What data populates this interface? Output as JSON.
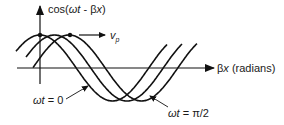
{
  "diagram": {
    "y_axis_label": {
      "prefix": "cos(",
      "omega_t": "ωt",
      "minus": " - β",
      "x": "x",
      "suffix": ")"
    },
    "x_axis_label": {
      "beta": "β",
      "x": "x",
      "units": " (radians)"
    },
    "velocity_label": {
      "v": "v",
      "sub": "p"
    },
    "annotations": [
      {
        "id": "wt0",
        "omega_t": "ωt",
        "eq": " = 0"
      },
      {
        "id": "wtpi2",
        "omega_t": "ωt",
        "eq": " = π/2"
      }
    ],
    "curves": [
      {
        "name": "omega-t-0",
        "phase_shift_fraction_of_period": 0.0
      },
      {
        "name": "omega-t-intermediate",
        "phase_shift_fraction_of_period": 0.1
      },
      {
        "name": "omega-t-pi-over-2",
        "phase_shift_fraction_of_period": 0.2
      }
    ],
    "colors": {
      "ink": "#111111",
      "background": "#ffffff"
    }
  }
}
